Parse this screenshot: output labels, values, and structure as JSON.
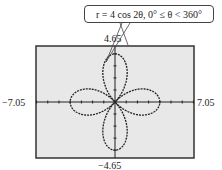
{
  "chart_data": {
    "type": "line",
    "subtype": "polar",
    "title": "r = 4 cos 2θ, 0° ≤ θ < 360°",
    "equation": "r = 4 cos 2θ",
    "domain": "0° ≤ θ < 360°",
    "xlim": [
      -7.05,
      7.05
    ],
    "ylim": [
      -4.65,
      4.65
    ],
    "xlabel": "",
    "ylabel": "",
    "tick_labels": {
      "xmin": "−7.05",
      "xmax": "7.05",
      "ymin": "−4.65",
      "ymax": "4.65"
    },
    "grid": false,
    "petals": 4,
    "amplitude": 4,
    "tick_spacing": 1,
    "background": "#e8e8e8",
    "curve_color": "#222222"
  },
  "labels": {
    "callout": "r = 4 cos 2θ, 0° ≤ θ < 360°",
    "ymax": "4.65",
    "ymin": "−4.65",
    "xmin": "−7.05",
    "xmax": "7.05"
  }
}
